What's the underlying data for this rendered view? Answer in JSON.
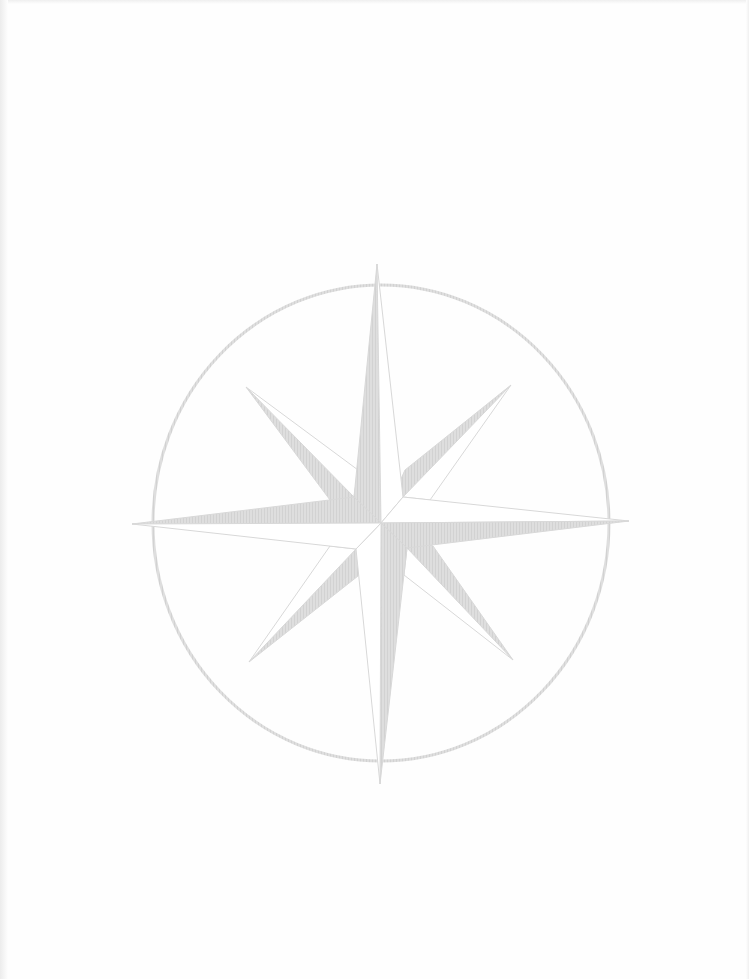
{
  "graphic": {
    "type": "compass-rose",
    "colors": {
      "background": "#fefefe",
      "shade": "#dcdcdc",
      "outline": "#d6d6d6",
      "light": "#ffffff"
    },
    "center": [
      381,
      523
    ],
    "ring": {
      "rx": 228,
      "ry": 238,
      "stroke_width": 3
    },
    "points": {
      "N": [
        377,
        264
      ],
      "S": [
        380,
        784
      ],
      "E": [
        629,
        521
      ],
      "W": [
        132,
        524
      ],
      "NE": [
        511,
        385
      ],
      "NW": [
        246,
        387
      ],
      "SE": [
        513,
        660
      ],
      "SW": [
        249,
        662
      ]
    }
  }
}
